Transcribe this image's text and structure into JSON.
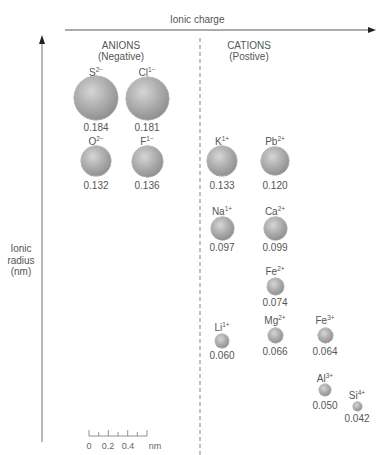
{
  "axes": {
    "x_title": "Ionic charge",
    "y_title_lines": [
      "Ionic",
      "radius",
      "(nm)"
    ]
  },
  "groups": {
    "anions": {
      "title": "ANIONS",
      "subtitle": "(Negative)"
    },
    "cations": {
      "title": "CATIONS",
      "subtitle": "(Postive)"
    }
  },
  "ions": [
    {
      "id": "s",
      "symbol": "S",
      "charge": "2−",
      "radius": "0.184",
      "cx": 96,
      "cy": 98,
      "r": 22,
      "label_y": 67,
      "value_y": 122
    },
    {
      "id": "cl",
      "symbol": "Cl",
      "charge": "1−",
      "radius": "0.181",
      "cx": 147,
      "cy": 98,
      "r": 21.5,
      "label_y": 67,
      "value_y": 122
    },
    {
      "id": "o",
      "symbol": "O",
      "charge": "2−",
      "radius": "0.132",
      "cx": 96,
      "cy": 161,
      "r": 15,
      "label_y": 136,
      "value_y": 180
    },
    {
      "id": "f",
      "symbol": "F",
      "charge": "1−",
      "radius": "0.136",
      "cx": 147,
      "cy": 161,
      "r": 15.5,
      "label_y": 136,
      "value_y": 180
    },
    {
      "id": "k",
      "symbol": "K",
      "charge": "1+",
      "radius": "0.133",
      "cx": 222,
      "cy": 161,
      "r": 15,
      "label_y": 136,
      "value_y": 180
    },
    {
      "id": "pb",
      "symbol": "Pb",
      "charge": "2+",
      "radius": "0.120",
      "cx": 275,
      "cy": 161,
      "r": 14,
      "label_y": 136,
      "value_y": 180
    },
    {
      "id": "na",
      "symbol": "Na",
      "charge": "1+",
      "radius": "0.097",
      "cx": 222,
      "cy": 228,
      "r": 11.5,
      "label_y": 206,
      "value_y": 242
    },
    {
      "id": "ca",
      "symbol": "Ca",
      "charge": "2+",
      "radius": "0.099",
      "cx": 275,
      "cy": 228,
      "r": 11.5,
      "label_y": 206,
      "value_y": 242
    },
    {
      "id": "fe2",
      "symbol": "Fe",
      "charge": "2+",
      "radius": "0.074",
      "cx": 275,
      "cy": 286,
      "r": 8.5,
      "label_y": 266,
      "value_y": 297
    },
    {
      "id": "li",
      "symbol": "Li",
      "charge": "1+",
      "radius": "0.060",
      "cx": 222,
      "cy": 341,
      "r": 7,
      "label_y": 322,
      "value_y": 350
    },
    {
      "id": "mg",
      "symbol": "Mg",
      "charge": "2+",
      "radius": "0.066",
      "cx": 275,
      "cy": 335,
      "r": 7.5,
      "label_y": 315,
      "value_y": 346
    },
    {
      "id": "fe3",
      "symbol": "Fe",
      "charge": "3+",
      "radius": "0.064",
      "cx": 325,
      "cy": 335,
      "r": 7.5,
      "label_y": 315,
      "value_y": 346
    },
    {
      "id": "al",
      "symbol": "Al",
      "charge": "3+",
      "radius": "0.050",
      "cx": 325,
      "cy": 390,
      "r": 6,
      "label_y": 373,
      "value_y": 400
    },
    {
      "id": "si",
      "symbol": "Si",
      "charge": "4+",
      "radius": "0.042",
      "cx": 357,
      "cy": 406,
      "r": 4.5,
      "label_y": 390,
      "value_y": 413
    }
  ],
  "scale_bar": {
    "labels": [
      "0",
      "0.2",
      "0.4",
      "nm"
    ]
  },
  "colors": {
    "axis": "#333333",
    "text": "#555555",
    "sphere_light": "#d6d6d6",
    "sphere_dark": "#7a7a7a"
  }
}
